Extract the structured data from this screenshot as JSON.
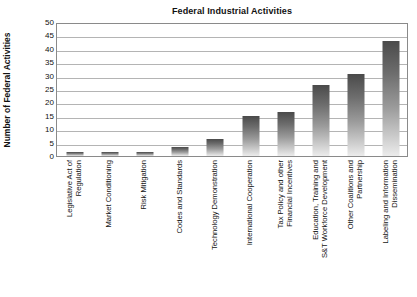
{
  "chart_data": {
    "type": "bar",
    "title": "Federal Industrial Activities",
    "xlabel": "",
    "ylabel": "Number of Federal Activities",
    "ylim": [
      0,
      50
    ],
    "ytick_step": 5,
    "yticks": [
      "50",
      "45",
      "40",
      "35",
      "30",
      "25",
      "20",
      "15",
      "10",
      "5",
      "0"
    ],
    "grid": "horizontal",
    "legend": "none",
    "categories": [
      "Legislative Act of Regulation",
      "Market Conditioning",
      "Risk Mitigation",
      "Codes and Standards",
      "Technology Demonstration",
      "International Cooperation",
      "Tax Policy and other Financial Incentives",
      "Education, Training and S&T Workforce Development",
      "Other Coalitions and Partnership",
      "Labeling and Information Dissemination"
    ],
    "category_lines": [
      [
        "Legislative Act of",
        "Regulation"
      ],
      [
        "Market Conditioning",
        ""
      ],
      [
        "Risk Mitigation",
        ""
      ],
      [
        "Codes and Standards",
        ""
      ],
      [
        "Technology Demonstration",
        ""
      ],
      [
        "International Cooperation",
        ""
      ],
      [
        "Tax Policy and other",
        "Financial Incentives"
      ],
      [
        "Education, Training and",
        "S&T Workforce Development"
      ],
      [
        "Other Coalitions and",
        "Partnership"
      ],
      [
        "Labeling and Information",
        "Dissemination"
      ]
    ],
    "values": [
      1.5,
      1.5,
      1.5,
      3.5,
      6.3,
      15,
      16.5,
      26.5,
      30.5,
      43
    ],
    "bar_color_top": "#4a4a4a",
    "bar_color_bottom": "#ececec",
    "grid_color": "#b4b4b4",
    "frame_color": "#8a8a8a"
  }
}
